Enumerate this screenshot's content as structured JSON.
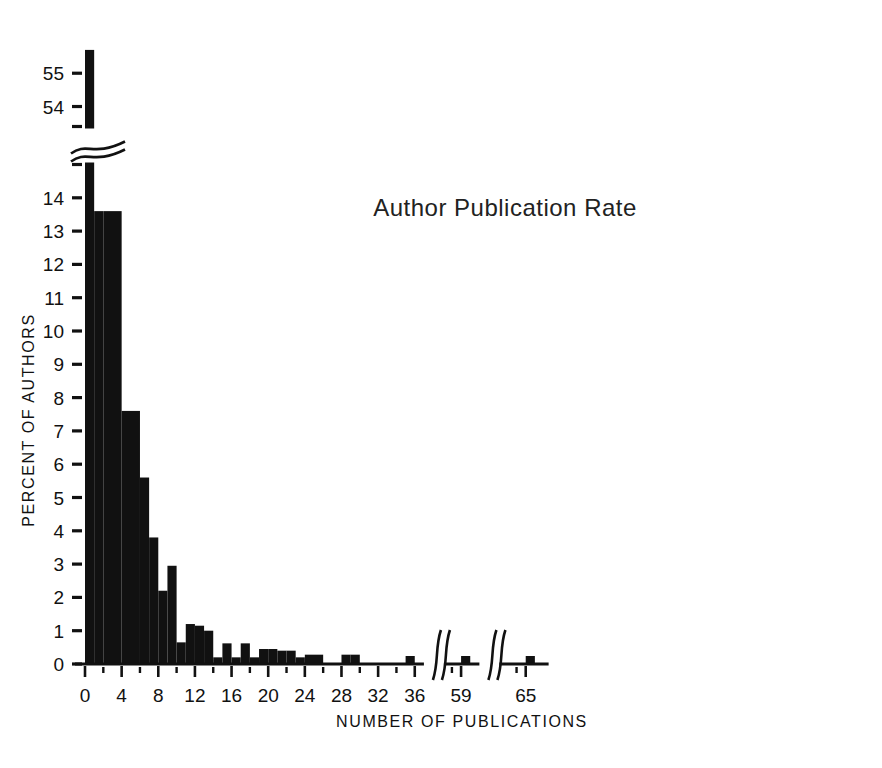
{
  "chart_data": {
    "type": "bar",
    "title": "Author  Publication  Rate",
    "xlabel": "NUMBER  OF  PUBLICATIONS",
    "ylabel": "PERCENT  OF  AUTHORS",
    "grid": false,
    "legend": null,
    "xlim": [
      -0.5,
      68
    ],
    "ylim": [
      0,
      56
    ],
    "y_axis_break": {
      "present": true,
      "below": 15.0,
      "above": 53.4,
      "note": "wavy break between the 14-15 region and the 54-55 region"
    },
    "x_axis_breaks": [
      {
        "present": true,
        "after": 37,
        "before": 58
      },
      {
        "present": true,
        "after": 60,
        "before": 63
      }
    ],
    "x_tick_labels": [
      "0",
      "4",
      "8",
      "12",
      "16",
      "20",
      "24",
      "28",
      "32",
      "36",
      "59",
      "65"
    ],
    "x_tick_values": [
      0,
      4,
      8,
      12,
      16,
      20,
      24,
      28,
      32,
      36,
      59,
      65
    ],
    "x_minor_tick_values": [
      2,
      6,
      10,
      14,
      18,
      22,
      26,
      30,
      34,
      58,
      64
    ],
    "y_tick_labels": [
      "0",
      "1",
      "2",
      "3",
      "4",
      "5",
      "6",
      "7",
      "8",
      "9",
      "10",
      "11",
      "12",
      "13",
      "14",
      "54",
      "55"
    ],
    "y_tick_values": [
      0,
      1,
      2,
      3,
      4,
      5,
      6,
      7,
      8,
      9,
      10,
      11,
      12,
      13,
      14,
      54,
      55
    ],
    "categories": [
      0,
      1,
      2,
      3,
      4,
      5,
      6,
      7,
      8,
      9,
      10,
      11,
      12,
      13,
      14,
      15,
      16,
      17,
      18,
      19,
      20,
      21,
      22,
      23,
      24,
      25,
      26,
      27,
      28,
      29,
      30,
      31,
      32,
      33,
      34,
      35,
      36,
      59,
      65
    ],
    "values": [
      55.7,
      13.6,
      13.6,
      7.6,
      7.6,
      5.6,
      5.6,
      3.8,
      3.8,
      2.2,
      2.95,
      0.65,
      0.65,
      1.2,
      1.2,
      1.0,
      0.2,
      0.0,
      0.62,
      0.62,
      0.52,
      0.52,
      0.4,
      0.4,
      0.4,
      0.4,
      0.3,
      0.3,
      0.0,
      0.28,
      0.0,
      0.0,
      0.0,
      0.3,
      0.0,
      0.0,
      0.0,
      0.0,
      0.0
    ],
    "bars": [
      {
        "x": 0,
        "width": 1,
        "value": 55.7,
        "label": "0"
      },
      {
        "x": 1,
        "width": 1,
        "value": 13.6,
        "label": "1"
      },
      {
        "x": 2,
        "width": 2,
        "value": 13.6,
        "label": "2-3"
      },
      {
        "x": 4,
        "width": 2,
        "value": 7.6,
        "label": "4-5"
      },
      {
        "x": 6,
        "width": 1,
        "value": 5.6,
        "label": "6"
      },
      {
        "x": 7,
        "width": 1,
        "value": 3.8,
        "label": "7"
      },
      {
        "x": 8,
        "width": 1,
        "value": 2.2,
        "label": "8"
      },
      {
        "x": 9,
        "width": 1,
        "value": 2.95,
        "label": "9"
      },
      {
        "x": 10,
        "width": 1,
        "value": 0.65,
        "label": "10"
      },
      {
        "x": 11,
        "width": 1,
        "value": 1.2,
        "label": "11"
      },
      {
        "x": 12,
        "width": 1,
        "value": 1.15,
        "label": "12"
      },
      {
        "x": 13,
        "width": 1,
        "value": 1.0,
        "label": "13"
      },
      {
        "x": 14,
        "width": 1,
        "value": 0.2,
        "label": "14"
      },
      {
        "x": 15,
        "width": 1,
        "value": 0.62,
        "label": "15"
      },
      {
        "x": 16,
        "width": 1,
        "value": 0.2,
        "label": "16"
      },
      {
        "x": 17,
        "width": 1,
        "value": 0.62,
        "label": "17"
      },
      {
        "x": 18,
        "width": 1,
        "value": 0.2,
        "label": "18"
      },
      {
        "x": 19,
        "width": 1,
        "value": 0.45,
        "label": "19"
      },
      {
        "x": 20,
        "width": 1,
        "value": 0.45,
        "label": "20"
      },
      {
        "x": 21,
        "width": 1,
        "value": 0.4,
        "label": "21"
      },
      {
        "x": 22,
        "width": 1,
        "value": 0.4,
        "label": "22"
      },
      {
        "x": 23,
        "width": 1,
        "value": 0.2,
        "label": "23"
      },
      {
        "x": 24,
        "width": 1,
        "value": 0.28,
        "label": "24"
      },
      {
        "x": 25,
        "width": 1,
        "value": 0.28,
        "label": "25"
      },
      {
        "x": 28,
        "width": 1,
        "value": 0.28,
        "label": "28"
      },
      {
        "x": 29,
        "width": 1,
        "value": 0.28,
        "label": "29"
      },
      {
        "x": 35,
        "width": 1,
        "value": 0.24,
        "label": "35"
      },
      {
        "x": 59,
        "width": 1,
        "value": 0.24,
        "label": "59"
      },
      {
        "x": 65,
        "width": 1,
        "value": 0.24,
        "label": "65"
      }
    ]
  },
  "figure": {
    "caption": ""
  }
}
